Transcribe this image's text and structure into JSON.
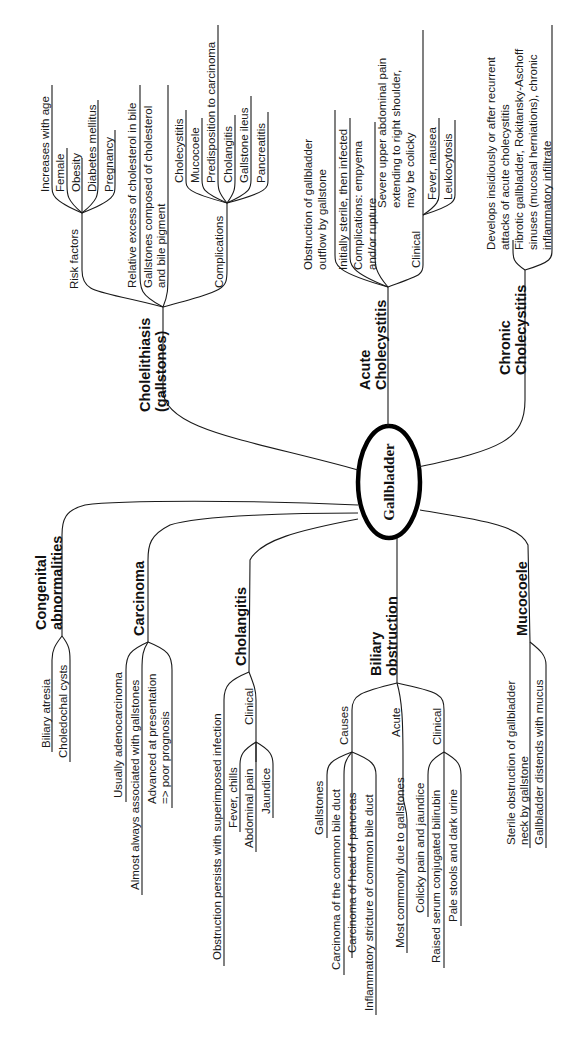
{
  "center": {
    "label": "Gallbladder"
  },
  "branches": {
    "cholelithiasis": {
      "title": [
        "Cholelithiasis",
        "(gallstones)"
      ],
      "risk_factors": {
        "label": "Risk factors",
        "items": [
          "Increases with age",
          "Female",
          "Obesity",
          "Diabetes mellitus",
          "Pregnancy"
        ]
      },
      "facts": [
        [
          "Relative excess of cholesterol in bile"
        ],
        [
          "Gallstones composed of cholesterol",
          "and bile pigment"
        ]
      ],
      "complications": {
        "label": "Complications",
        "items": [
          "Cholecystitis",
          "Mucocoele",
          "Predisposition to carcinoma",
          "Cholangitis",
          "Gallstone ileus",
          "Pancreatitis"
        ]
      }
    },
    "acute_cholecystitis": {
      "title": [
        "Acute",
        "Cholecystitis"
      ],
      "facts": [
        [
          "Obstruction of gallbladder",
          "outflow by gallstone"
        ],
        [
          "Initially sterile, then infected"
        ],
        [
          "Complications: empyema",
          "and/or rupture"
        ]
      ],
      "clinical": {
        "label": "Clinical",
        "items": [
          [
            "Severe upper abdominal pain",
            "extending to right shoulder,",
            "may be colicky"
          ],
          [
            "Fever, nausea"
          ],
          [
            "Leukocytosis"
          ]
        ]
      }
    },
    "chronic_cholecystitis": {
      "title": [
        "Chronic",
        "Cholecystitis"
      ],
      "facts": [
        [
          "Develops insidiously or after recurrent",
          "attacks of acute cholecystitis"
        ],
        [
          "Fibrotic gallbladder, Rokitansky-Aschoff",
          "sinuses (mucosal herniations), chronic",
          "inflammatory infiltrate"
        ]
      ]
    },
    "congenital": {
      "title": [
        "Congenital",
        "abnormalities"
      ],
      "items": [
        "Biliary atresia",
        "Choledochal cysts"
      ]
    },
    "carcinoma": {
      "title": [
        "Carcinoma"
      ],
      "items": [
        [
          "Usually adenocarcinoma"
        ],
        [
          "Almost always associated with gallstones"
        ],
        [
          "Advanced at presentation",
          "=> poor prognosis"
        ]
      ]
    },
    "cholangitis": {
      "title": [
        "Cholangitis"
      ],
      "facts": [
        [
          "Obstruction persists with superimposed infection"
        ]
      ],
      "clinical": {
        "label": "Clinical",
        "items": [
          "Fever, chills",
          "Abdominal pain",
          "Jaundice"
        ]
      }
    },
    "biliary_obstruction": {
      "title": [
        "Biliary",
        "obstruction"
      ],
      "causes": {
        "label": "Causes",
        "items": [
          "Gallstones",
          "Carcinoma of the common bile duct",
          "Carcinoma of head of pancreas",
          "Inflammatory stricture of common bile duct"
        ]
      },
      "acute": {
        "label": "Acute",
        "items": [
          "Most commonly due to gallstones"
        ]
      },
      "clinical": {
        "label": "Clinical",
        "items": [
          "Colicky pain and jaundice",
          "Raised serum conjugated bilirubin",
          "Pale stools and dark urine"
        ]
      }
    },
    "mucocoele": {
      "title": [
        "Mucocoele"
      ],
      "items": [
        [
          "Sterile obstruction of gallbladder",
          "neck by gallstone"
        ],
        [
          "Gallbladder distends with mucus"
        ]
      ]
    }
  }
}
